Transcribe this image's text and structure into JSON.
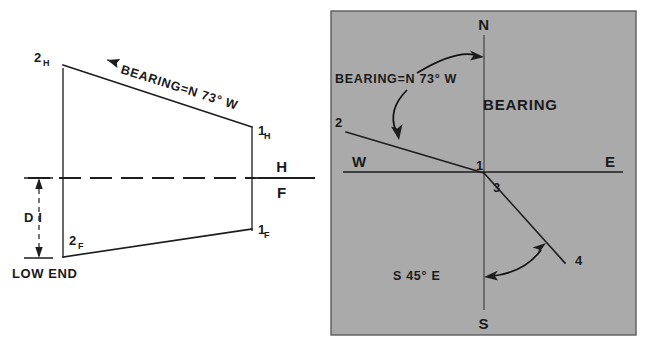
{
  "figure": {
    "background_color": "#ffffff",
    "ink_color": "#1d1d1d",
    "panel_fill": "#aaaaaa"
  },
  "left_diagram": {
    "name": "orthographic-projection-bearing",
    "labels": {
      "point_2h_main": "2",
      "point_2h_sub": "H",
      "point_1h_main": "1",
      "point_1h_sub": "H",
      "point_2f_main": "2",
      "point_2f_sub": "F",
      "point_1f_main": "1",
      "point_1f_sub": "F",
      "fold_top": "H",
      "fold_bottom": "F",
      "dimension": "D I",
      "low_end": "LOW END",
      "bearing_note": "BEARING=N 73° W"
    }
  },
  "right_diagram": {
    "name": "compass-bearing-panel",
    "title": "BEARING",
    "panel_color": "#aaaaaa",
    "compass": {
      "north": "N",
      "south": "S",
      "east": "E",
      "west": "W"
    },
    "points": {
      "p1": "1",
      "p2": "2",
      "p3": "3",
      "p4": "4"
    },
    "annotations": {
      "bearing_nw": "BEARING=N 73° W",
      "bearing_se": "S 45° E"
    }
  }
}
